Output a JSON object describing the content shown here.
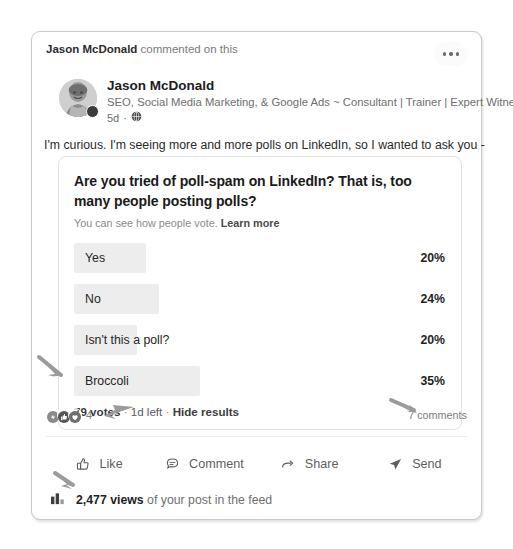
{
  "post": {
    "context_actor": "Jason McDonald",
    "context_action": "commented on this",
    "menu_icon": "more-options-icon",
    "author": {
      "name": "Jason McDonald",
      "headline": "SEO, Social Media Marketing, & Google Ads ~ Consultant | Trainer | Expert Witness",
      "time": "5d",
      "separator": "·",
      "visibility_icon": "globe-icon"
    },
    "body_text": "I'm curious. I'm seeing more and more polls on LinkedIn, so I wanted to ask you -"
  },
  "poll": {
    "question": "Are you tried of poll-spam on LinkedIn? That is, too many people posting polls?",
    "sub_text": "You can see how people vote.",
    "learn_more": "Learn more",
    "options": [
      {
        "label": "Yes",
        "percent": "20%",
        "bar_width": 72
      },
      {
        "label": "No",
        "percent": "24%",
        "bar_width": 85
      },
      {
        "label": "Isn't this a poll?",
        "percent": "20%",
        "bar_width": 63
      },
      {
        "label": "Broccoli",
        "percent": "35%",
        "bar_width": 126
      }
    ],
    "votes": "79 votes",
    "sep1": " · ",
    "time_left": "1d left",
    "sep2": " · ",
    "hide_results": "Hide results"
  },
  "social": {
    "reaction_count": "4",
    "reaction_icons": [
      "celebrate-reaction-icon",
      "like-reaction-icon",
      "love-reaction-icon"
    ],
    "comments": "7 comments"
  },
  "actions": [
    {
      "label": "Like",
      "icon": "thumbs-up-icon"
    },
    {
      "label": "Comment",
      "icon": "speech-bubble-icon"
    },
    {
      "label": "Share",
      "icon": "share-arrow-icon"
    },
    {
      "label": "Send",
      "icon": "paper-plane-icon"
    }
  ],
  "views": {
    "icon": "bar-chart-icon",
    "count": "2,477 views",
    "suffix": "of your post in the feed"
  },
  "colors": {
    "card_border": "#c8c8c8",
    "poll_bar": "#ededed",
    "text_primary": "#1f1f1f",
    "text_secondary": "#6f6f6f"
  }
}
